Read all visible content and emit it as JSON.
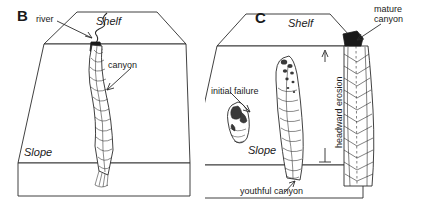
{
  "figure": {
    "type": "block-diagram",
    "line_color": "#2b2b2b",
    "fill_color": "#ffffff",
    "background": "#ffffff"
  },
  "panels": [
    {
      "id": "B",
      "letter": "B",
      "surfaces": {
        "shelf": "Shelf",
        "slope": "Slope"
      },
      "annotations": [
        {
          "name": "river",
          "text": "river"
        },
        {
          "name": "canyon",
          "text": "canyon"
        }
      ]
    },
    {
      "id": "C",
      "letter": "C",
      "surfaces": {
        "shelf": "Shelf",
        "slope": "Slope"
      },
      "annotations": [
        {
          "name": "mature-canyon",
          "text": "mature\ncanyon",
          "line1": "mature",
          "line2": "canyon"
        },
        {
          "name": "initial-failure",
          "text": "initial failure"
        },
        {
          "name": "headward-erosion",
          "text": "headward erosion"
        },
        {
          "name": "youthful-canyon",
          "text": "youthful canyon"
        }
      ]
    }
  ]
}
